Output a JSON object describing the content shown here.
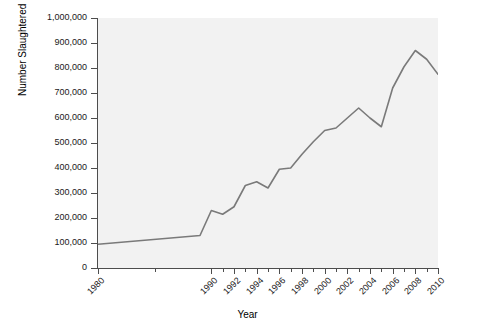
{
  "chart_data": {
    "type": "line",
    "title": "",
    "xlabel": "Year",
    "ylabel": "Number Slaughtered",
    "xlim": [
      1980,
      2010
    ],
    "ylim": [
      0,
      1000000
    ],
    "grid": false,
    "legend": false,
    "line_color": "#7a7a7a",
    "plot_bgcolor": "#f2f2f2",
    "axis_color": "#4d4d4d",
    "x": [
      1980,
      1989,
      1990,
      1991,
      1992,
      1993,
      1994,
      1995,
      1996,
      1997,
      1998,
      1999,
      2000,
      2001,
      2002,
      2003,
      2004,
      2005,
      2006,
      2007,
      2008,
      2009,
      2010
    ],
    "values": [
      95000,
      130000,
      230000,
      215000,
      245000,
      330000,
      345000,
      320000,
      395000,
      400000,
      455000,
      505000,
      550000,
      560000,
      600000,
      640000,
      600000,
      565000,
      720000,
      805000,
      870000,
      835000,
      775000
    ],
    "x_tick_labels": [
      "1980",
      "1990",
      "1992",
      "1994",
      "1996",
      "1998",
      "2000",
      "2002",
      "2004",
      "2006",
      "2008",
      "2010"
    ],
    "x_tick_values": [
      1980,
      1990,
      1992,
      1994,
      1996,
      1998,
      2000,
      2002,
      2004,
      2006,
      2008,
      2010
    ],
    "x_minor_tick_values": [
      1985,
      1991,
      1993,
      1995,
      1997,
      1999,
      2001,
      2003,
      2005,
      2007,
      2009
    ],
    "y_tick_labels": [
      "0",
      "100,000",
      "200,000",
      "300,000",
      "400,000",
      "500,000",
      "600,000",
      "700,000",
      "800,000",
      "900,000",
      "1,000,000"
    ],
    "y_tick_values": [
      0,
      100000,
      200000,
      300000,
      400000,
      500000,
      600000,
      700000,
      800000,
      900000,
      1000000
    ]
  }
}
